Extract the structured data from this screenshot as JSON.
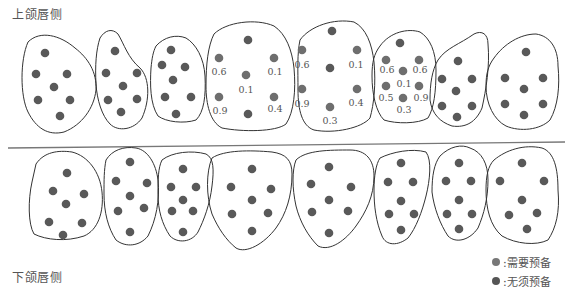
{
  "titles": {
    "upper": "上颌唇侧",
    "lower": "下颌唇侧"
  },
  "legend": [
    {
      "label": ":需要预备",
      "color": "#777777"
    },
    {
      "label": ":无须预备",
      "color": "#555555"
    }
  ],
  "colors": {
    "outline": "#333333",
    "dot_prep": "#6e6e6e",
    "dot_noprep": "#595959",
    "label": "#555555",
    "divider": "#777777"
  },
  "divider": {
    "x1": 8,
    "y1": 148,
    "x2": 565,
    "y2": 142
  },
  "upper_teeth": [
    {
      "name": "upper-tooth-1",
      "path": "M 28 42 C 40 30 60 35 75 48 C 88 58 97 72 96 90 C 94 108 82 125 64 132 C 48 136 36 128 28 112 C 20 96 20 60 28 42 Z",
      "dots": [
        [
          45,
          53,
          0
        ],
        [
          36,
          74,
          0
        ],
        [
          67,
          74,
          0
        ],
        [
          54,
          87,
          0
        ],
        [
          38,
          100,
          0
        ],
        [
          70,
          100,
          0
        ],
        [
          60,
          116,
          0
        ]
      ],
      "labels": []
    },
    {
      "name": "upper-tooth-2",
      "path": "M 100 38 C 105 30 112 28 118 34 C 124 44 128 58 140 68 C 150 78 150 100 142 118 C 134 130 118 132 110 124 C 102 116 97 100 96 84 C 95 66 96 50 100 38 Z",
      "dots": [
        [
          115,
          51,
          0
        ],
        [
          106,
          73,
          0
        ],
        [
          137,
          73,
          0
        ],
        [
          123,
          86,
          0
        ],
        [
          108,
          100,
          0
        ],
        [
          137,
          99,
          0
        ],
        [
          121,
          112,
          0
        ]
      ],
      "labels": []
    },
    {
      "name": "upper-tooth-3",
      "path": "M 156 46 C 164 37 176 34 186 38 C 196 44 204 58 205 76 C 206 96 204 112 196 120 C 184 124 166 122 158 116 C 150 104 150 84 151 68 C 152 58 153 52 156 46 Z",
      "dots": [
        [
          171,
          50,
          0
        ],
        [
          162,
          65,
          0
        ],
        [
          185,
          67,
          0
        ],
        [
          173,
          80,
          0
        ],
        [
          165,
          97,
          0
        ],
        [
          191,
          97,
          0
        ],
        [
          176,
          114,
          0
        ]
      ],
      "labels": []
    },
    {
      "name": "upper-tooth-4",
      "path": "M 214 34 C 226 22 256 18 274 26 C 286 34 292 50 294 68 C 296 90 294 112 286 124 C 276 132 242 132 222 128 C 210 122 206 104 206 86 C 206 64 208 46 214 34 Z",
      "dots": [
        [
          248,
          40,
          0
        ],
        [
          219,
          58,
          1
        ],
        [
          274,
          58,
          1
        ],
        [
          246,
          75,
          1
        ],
        [
          219,
          97,
          1
        ],
        [
          274,
          97,
          1
        ],
        [
          248,
          114,
          0
        ]
      ],
      "labels": [
        [
          "0.6",
          219,
          75
        ],
        [
          "0.1",
          275,
          75
        ],
        [
          "0.1",
          246,
          93
        ],
        [
          "0.9",
          220,
          114
        ],
        [
          "0.4",
          275,
          112
        ]
      ]
    },
    {
      "name": "upper-tooth-5",
      "path": "M 300 40 C 310 26 334 18 354 22 C 366 28 372 44 374 62 C 376 84 374 104 370 118 C 362 128 334 134 314 130 C 302 126 298 110 298 90 C 298 70 297 54 300 40 Z",
      "dots": [
        [
          332,
          31,
          0
        ],
        [
          302,
          50,
          1
        ],
        [
          357,
          50,
          1
        ],
        [
          330,
          68,
          0
        ],
        [
          302,
          89,
          1
        ],
        [
          357,
          89,
          1
        ],
        [
          330,
          107,
          1
        ]
      ],
      "labels": [
        [
          "0.6",
          302,
          68
        ],
        [
          "0.1",
          356,
          68
        ],
        [
          "0.9",
          302,
          107
        ],
        [
          "0.4",
          356,
          106
        ],
        [
          "0.3",
          330,
          124
        ]
      ]
    },
    {
      "name": "upper-tooth-6",
      "path": "M 380 46 C 390 32 408 28 420 32 C 430 38 436 52 436 70 C 436 92 434 108 428 118 C 418 124 396 124 384 120 C 376 112 372 94 372 76 C 372 62 374 54 380 46 Z",
      "dots": [
        [
          400,
          43,
          0
        ],
        [
          386,
          60,
          1
        ],
        [
          419,
          60,
          1
        ],
        [
          403,
          71,
          1
        ],
        [
          386,
          86,
          1
        ],
        [
          419,
          86,
          1
        ],
        [
          403,
          98,
          1
        ]
      ],
      "labels": [
        [
          "0.6",
          387,
          73
        ],
        [
          "0.6",
          420,
          73
        ],
        [
          "0.1",
          404,
          87
        ],
        [
          "0.5",
          386,
          101
        ],
        [
          "0.9",
          421,
          101
        ],
        [
          "0.3",
          404,
          113
        ]
      ]
    },
    {
      "name": "upper-tooth-7",
      "path": "M 438 60 C 446 48 460 44 474 34 C 482 30 488 34 488 44 C 490 66 486 90 482 108 C 476 122 466 128 452 126 C 440 122 432 114 430 100 C 430 84 432 70 438 60 Z",
      "dots": [
        [
          458,
          61,
          0
        ],
        [
          442,
          79,
          0
        ],
        [
          472,
          79,
          0
        ],
        [
          456,
          91,
          0
        ],
        [
          442,
          106,
          0
        ],
        [
          472,
          106,
          0
        ],
        [
          457,
          117,
          0
        ]
      ],
      "labels": []
    },
    {
      "name": "upper-tooth-8",
      "path": "M 494 58 C 504 44 520 34 536 34 C 550 36 558 48 558 66 C 560 86 558 106 550 120 C 540 130 520 132 506 126 C 494 120 486 104 486 86 C 486 74 488 66 494 58 Z",
      "dots": [
        [
          526,
          52,
          0
        ],
        [
          505,
          78,
          0
        ],
        [
          543,
          78,
          0
        ],
        [
          524,
          89,
          0
        ],
        [
          505,
          104,
          0
        ],
        [
          543,
          104,
          0
        ],
        [
          524,
          115,
          0
        ]
      ],
      "labels": []
    }
  ],
  "lower_teeth": [
    {
      "name": "lower-tooth-1",
      "path": "M 36 164 C 44 152 58 150 72 152 C 88 156 100 172 102 192 C 104 212 98 230 84 236 C 66 242 46 240 34 234 C 28 224 28 200 32 182 Z",
      "dots": [
        [
          67,
          173,
          0
        ],
        [
          53,
          191,
          0
        ],
        [
          84,
          194,
          0
        ],
        [
          66,
          204,
          0
        ],
        [
          49,
          222,
          0
        ],
        [
          82,
          223,
          0
        ],
        [
          63,
          235,
          0
        ]
      ],
      "labels": []
    },
    {
      "name": "lower-tooth-2",
      "path": "M 106 160 C 112 150 124 146 136 148 C 148 150 156 164 158 180 C 160 200 156 220 148 236 C 140 246 126 248 116 240 C 108 228 104 212 104 194 C 104 180 104 170 106 160 Z",
      "dots": [
        [
          130,
          162,
          0
        ],
        [
          116,
          181,
          0
        ],
        [
          147,
          183,
          0
        ],
        [
          130,
          196,
          0
        ],
        [
          118,
          211,
          0
        ],
        [
          144,
          208,
          0
        ],
        [
          130,
          232,
          0
        ]
      ],
      "labels": []
    },
    {
      "name": "lower-tooth-3",
      "path": "M 162 160 C 172 152 192 150 206 154 C 214 158 214 170 212 186 C 210 204 204 220 198 232 C 192 242 178 244 170 236 C 162 224 158 210 158 194 C 158 180 158 168 162 160 Z",
      "dots": [
        [
          183,
          169,
          0
        ],
        [
          171,
          187,
          0
        ],
        [
          196,
          187,
          0
        ],
        [
          183,
          200,
          0
        ],
        [
          172,
          211,
          0
        ],
        [
          193,
          211,
          0
        ],
        [
          183,
          232,
          0
        ]
      ],
      "labels": []
    },
    {
      "name": "lower-tooth-4",
      "path": "M 212 158 C 224 150 250 150 272 152 C 286 154 292 160 292 174 C 292 196 286 214 276 228 C 264 244 246 254 236 248 C 226 240 218 228 212 214 C 206 196 206 172 212 158 Z",
      "dots": [
        [
          252,
          169,
          0
        ],
        [
          231,
          187,
          0
        ],
        [
          271,
          189,
          0
        ],
        [
          252,
          200,
          0
        ],
        [
          232,
          214,
          0
        ],
        [
          268,
          213,
          0
        ],
        [
          252,
          231,
          0
        ]
      ],
      "labels": []
    },
    {
      "name": "lower-tooth-5",
      "path": "M 296 160 C 306 150 330 150 350 150 C 366 150 374 160 374 176 C 374 196 366 212 356 226 C 346 240 330 252 318 246 C 308 236 300 222 296 206 C 292 188 292 170 296 160 Z",
      "dots": [
        [
          329,
          167,
          0
        ],
        [
          311,
          184,
          0
        ],
        [
          351,
          187,
          0
        ],
        [
          329,
          200,
          0
        ],
        [
          312,
          212,
          0
        ],
        [
          348,
          211,
          0
        ],
        [
          329,
          233,
          0
        ]
      ],
      "labels": []
    },
    {
      "name": "lower-tooth-6",
      "path": "M 380 158 C 392 152 412 148 426 152 C 432 160 430 180 426 196 C 422 212 416 228 408 238 C 398 246 386 246 382 236 C 376 222 374 206 374 190 C 374 176 376 164 380 158 Z",
      "dots": [
        [
          401,
          163,
          0
        ],
        [
          388,
          182,
          0
        ],
        [
          413,
          182,
          0
        ],
        [
          401,
          201,
          0
        ],
        [
          389,
          214,
          0
        ],
        [
          414,
          214,
          0
        ],
        [
          401,
          230,
          0
        ]
      ],
      "labels": []
    },
    {
      "name": "lower-tooth-7",
      "path": "M 440 156 C 450 146 462 144 470 148 C 482 152 488 164 488 180 C 488 198 484 214 478 228 C 470 240 456 244 448 236 C 440 224 434 208 432 192 C 432 176 434 164 440 156 Z",
      "dots": [
        [
          459,
          163,
          0
        ],
        [
          446,
          181,
          0
        ],
        [
          471,
          181,
          0
        ],
        [
          459,
          200,
          0
        ],
        [
          447,
          214,
          0
        ],
        [
          472,
          214,
          0
        ],
        [
          459,
          229,
          0
        ]
      ],
      "labels": []
    },
    {
      "name": "lower-tooth-8",
      "path": "M 494 160 C 506 150 524 144 542 148 C 554 152 558 168 558 190 C 560 212 556 228 548 240 C 536 246 516 244 502 236 C 490 226 486 208 486 190 C 486 176 488 166 494 160 Z",
      "dots": [
        [
          522,
          163,
          0
        ],
        [
          500,
          181,
          0
        ],
        [
          544,
          181,
          0
        ],
        [
          522,
          200,
          0
        ],
        [
          509,
          215,
          0
        ],
        [
          537,
          213,
          0
        ],
        [
          527,
          229,
          0
        ]
      ],
      "labels": []
    }
  ]
}
